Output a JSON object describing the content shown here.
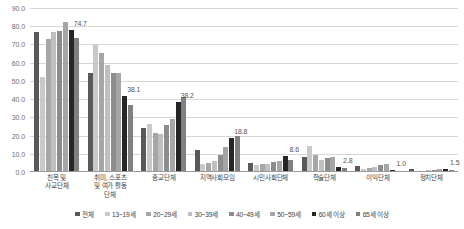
{
  "chart_data": {
    "type": "bar",
    "title": "",
    "subtitle": "",
    "xlabel": "",
    "ylabel": "",
    "ylim": [
      0,
      90
    ],
    "grid": true,
    "legend_position": "bottom",
    "y_ticks": [
      "0.0",
      "10.0",
      "20.0",
      "30.0",
      "40.0",
      "50.0",
      "60.0",
      "70.0",
      "80.0",
      "90.0"
    ],
    "categories": [
      "친목 및\n사교단체",
      "취미, 스포츠\n및 여가 활동\n단체",
      "종교단체",
      "지역사회모임",
      "시민사회단체",
      "학술단체",
      "이익단체",
      "정치단체"
    ],
    "series": [
      {
        "name": "전체",
        "color": "#595959",
        "values": [
          76.8,
          54.1,
          24.3,
          11.9,
          5.2,
          8.3,
          3.1,
          1.6
        ]
      },
      {
        "name": "13~19세",
        "color": "#c9c9c9",
        "values": [
          52.2,
          69.6,
          26.2,
          4.6,
          3.6,
          14.4,
          1.4,
          0.5
        ]
      },
      {
        "name": "20~29세",
        "color": "#a6a6a6",
        "values": [
          72.8,
          65.4,
          21.3,
          5.1,
          4.2,
          9.6,
          2.1,
          0.7
        ]
      },
      {
        "name": "30~39세",
        "color": "#bfbfbf",
        "values": [
          76.6,
          58.9,
          20.8,
          5.9,
          4.6,
          6.6,
          2.6,
          0.9
        ]
      },
      {
        "name": "40~49세",
        "color": "#8c8c8c",
        "values": [
          77.5,
          54.3,
          25.9,
          9.6,
          5.4,
          7.9,
          3.9,
          1.2
        ]
      },
      {
        "name": "50~59세",
        "color": "#a6a6a6",
        "values": [
          82.5,
          54.2,
          29.1,
          13.8,
          6.0,
          8.4,
          4.2,
          1.4
        ]
      },
      {
        "name": "60세 이상",
        "color": "#262626",
        "values": [
          78.1,
          41.9,
          38.2,
          18.8,
          8.6,
          2.8,
          1.0,
          1.5
        ]
      },
      {
        "name": "65세 이상",
        "color": "#808080",
        "values": [
          73.8,
          37.0,
          41.3,
          19.8,
          6.6,
          2.2,
          0.8,
          1.3
        ]
      }
    ],
    "data_labels": [
      {
        "category_index": 0,
        "series_index": 6,
        "text": "74.7"
      },
      {
        "category_index": 1,
        "series_index": 6,
        "text": "38.1"
      },
      {
        "category_index": 2,
        "series_index": 6,
        "text": "38.2"
      },
      {
        "category_index": 3,
        "series_index": 6,
        "text": "18.8"
      },
      {
        "category_index": 4,
        "series_index": 6,
        "text": "8.6"
      },
      {
        "category_index": 5,
        "series_index": 6,
        "text": "2.8"
      },
      {
        "category_index": 6,
        "series_index": 6,
        "text": "1.0"
      },
      {
        "category_index": 7,
        "series_index": 6,
        "text": "1.5"
      }
    ],
    "colors": {
      "grid": "#d6d6d6",
      "axis": "#9a9a9a",
      "tick_text": "#6e6e6e",
      "label_text": "#3d3d3d",
      "background": "#ffffff"
    }
  }
}
